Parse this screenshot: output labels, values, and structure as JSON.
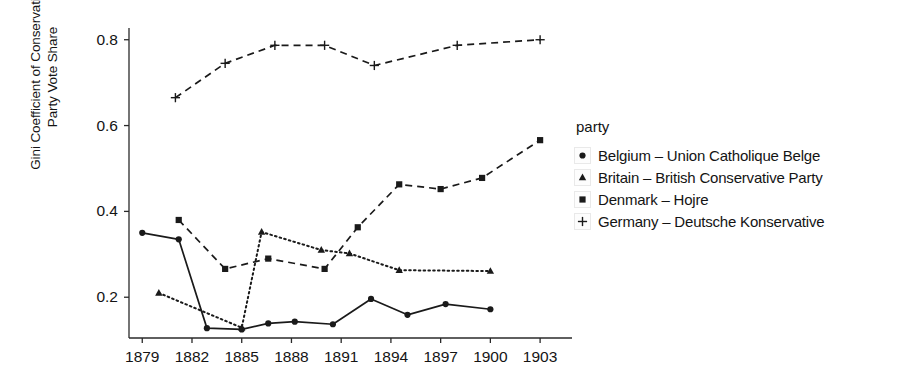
{
  "chart_data": {
    "type": "line",
    "title": "",
    "xlabel": "",
    "ylabel": "Gini Coefficient of Conservative\nParty Vote Share",
    "xlim": [
      1878.2,
      1904.2
    ],
    "ylim": [
      0.105,
      0.825
    ],
    "xticks": [
      1879,
      1882,
      1885,
      1888,
      1891,
      1894,
      1897,
      1900,
      1903
    ],
    "xticklabels": [
      "1879",
      "1882",
      "1885",
      "1888",
      "1891",
      "1894",
      "1897",
      "1900",
      "1903"
    ],
    "yticks": [
      0.2,
      0.4,
      0.6,
      0.8
    ],
    "yticklabels": [
      "0.2",
      "0.4",
      "0.6",
      "0.8"
    ],
    "grid": false,
    "legend_title": "party",
    "legend_position": "right",
    "series": [
      {
        "name": "Belgium – Union Catholique Belge",
        "marker": "circle",
        "linestyle": "solid",
        "color": "#1a1a1a",
        "points": [
          {
            "x": 1879.0,
            "y": 0.35
          },
          {
            "x": 1881.2,
            "y": 0.335
          },
          {
            "x": 1882.9,
            "y": 0.128
          },
          {
            "x": 1885.0,
            "y": 0.125
          },
          {
            "x": 1886.6,
            "y": 0.139
          },
          {
            "x": 1888.2,
            "y": 0.143
          },
          {
            "x": 1890.5,
            "y": 0.137
          },
          {
            "x": 1892.8,
            "y": 0.196
          },
          {
            "x": 1895.0,
            "y": 0.159
          },
          {
            "x": 1897.3,
            "y": 0.184
          },
          {
            "x": 1900.0,
            "y": 0.172
          }
        ]
      },
      {
        "name": "Britain – British Conservative Party",
        "marker": "triangle",
        "linestyle": "dotted",
        "color": "#1a1a1a",
        "points": [
          {
            "x": 1880.0,
            "y": 0.21
          },
          {
            "x": 1885.0,
            "y": 0.129
          },
          {
            "x": 1886.2,
            "y": 0.352
          },
          {
            "x": 1889.8,
            "y": 0.31
          },
          {
            "x": 1891.5,
            "y": 0.302
          },
          {
            "x": 1894.5,
            "y": 0.263
          },
          {
            "x": 1900.0,
            "y": 0.261
          }
        ]
      },
      {
        "name": "Denmark – Hojre",
        "marker": "square",
        "linestyle": "dashed",
        "color": "#1a1a1a",
        "points": [
          {
            "x": 1881.2,
            "y": 0.38
          },
          {
            "x": 1884.0,
            "y": 0.266
          },
          {
            "x": 1886.6,
            "y": 0.29
          },
          {
            "x": 1890.0,
            "y": 0.266
          },
          {
            "x": 1892.0,
            "y": 0.363
          },
          {
            "x": 1894.5,
            "y": 0.463
          },
          {
            "x": 1897.0,
            "y": 0.452
          },
          {
            "x": 1899.5,
            "y": 0.478
          },
          {
            "x": 1903.0,
            "y": 0.566
          }
        ]
      },
      {
        "name": "Germany – Deutsche Konservative",
        "marker": "plus",
        "linestyle": "dashed",
        "color": "#1a1a1a",
        "points": [
          {
            "x": 1881.0,
            "y": 0.665
          },
          {
            "x": 1884.0,
            "y": 0.745
          },
          {
            "x": 1887.0,
            "y": 0.787
          },
          {
            "x": 1890.0,
            "y": 0.787
          },
          {
            "x": 1893.0,
            "y": 0.74
          },
          {
            "x": 1898.0,
            "y": 0.787
          },
          {
            "x": 1903.0,
            "y": 0.8
          }
        ]
      }
    ]
  },
  "axis": {
    "y_axis_title_line1": "Gini Coefficient of Conservative",
    "y_axis_title_line2": "Party Vote Share"
  },
  "legend": {
    "title": "party",
    "entries": [
      {
        "label": "Belgium – Union Catholique Belge",
        "marker": "circle-marker-icon"
      },
      {
        "label": "Britain – British Conservative Party",
        "marker": "triangle-marker-icon"
      },
      {
        "label": "Denmark – Hojre",
        "marker": "square-marker-icon"
      },
      {
        "label": "Germany – Deutsche Konservative",
        "marker": "plus-marker-icon"
      }
    ]
  }
}
